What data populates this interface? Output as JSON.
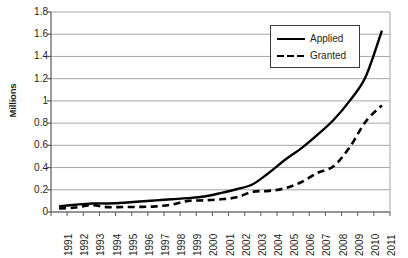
{
  "chart_data": {
    "type": "line",
    "title": "",
    "xlabel": "",
    "ylabel": "Millions",
    "ylim": [
      0,
      1.8
    ],
    "ytick_labels": [
      "1.8",
      "1.6",
      "1.4",
      "1.2",
      "1",
      "0.8",
      "0.6",
      "0.4",
      "0.2",
      "0"
    ],
    "ytick_values": [
      1.8,
      1.6,
      1.4,
      1.2,
      1.0,
      0.8,
      0.6,
      0.4,
      0.2,
      0
    ],
    "grid": true,
    "legend_position": "upper right",
    "categories": [
      "1991",
      "1992",
      "1993",
      "1994",
      "1995",
      "1996",
      "1997",
      "1998",
      "1999",
      "2000",
      "2001",
      "2002",
      "2003",
      "2004",
      "2005",
      "2006",
      "2007",
      "2008",
      "2009",
      "2010",
      "2011"
    ],
    "x": [
      1991,
      1992,
      1993,
      1994,
      1995,
      1996,
      1997,
      1998,
      1999,
      2000,
      2001,
      2002,
      2003,
      2004,
      2005,
      2006,
      2007,
      2008,
      2009,
      2010,
      2011
    ],
    "series": [
      {
        "name": "Applied",
        "style": "solid",
        "color": "#000000",
        "values": [
          0.05,
          0.065,
          0.077,
          0.077,
          0.083,
          0.095,
          0.105,
          0.115,
          0.125,
          0.14,
          0.17,
          0.205,
          0.25,
          0.353,
          0.47,
          0.573,
          0.694,
          0.828,
          1.0,
          1.22,
          1.633
        ]
      },
      {
        "name": "Granted",
        "style": "dashed",
        "color": "#000000",
        "values": [
          0.031,
          0.04,
          0.062,
          0.044,
          0.045,
          0.046,
          0.051,
          0.067,
          0.1,
          0.105,
          0.114,
          0.132,
          0.182,
          0.19,
          0.214,
          0.268,
          0.352,
          0.412,
          0.582,
          0.815,
          0.96
        ]
      }
    ]
  },
  "legend": {
    "items": [
      {
        "label": "Applied",
        "style": "solid"
      },
      {
        "label": "Granted",
        "style": "dashed"
      }
    ]
  }
}
